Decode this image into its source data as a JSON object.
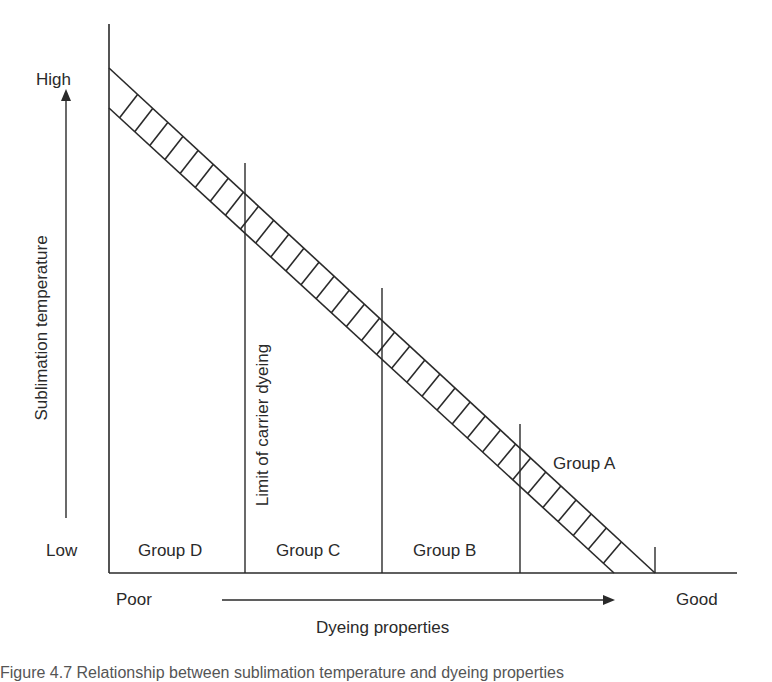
{
  "diagram": {
    "y_axis": {
      "label": "Sublimation temperature",
      "high_label": "High",
      "low_label": "Low"
    },
    "x_axis": {
      "label": "Dyeing properties",
      "poor_label": "Poor",
      "good_label": "Good"
    },
    "groups": [
      {
        "label": "Group D"
      },
      {
        "label": "Group C"
      },
      {
        "label": "Group B"
      },
      {
        "label": "Group A"
      }
    ],
    "annotation": "Limit of carrier dyeing",
    "band": {
      "description": "Hatched diagonal band from high sublimation temperature / poor dyeing to low sublimation temperature / good dyeing",
      "hatch_count": 33
    },
    "colors": {
      "line": "#2a2a2a",
      "background": "#ffffff"
    }
  },
  "caption": "Figure 4.7 Relationship between sublimation temperature and dyeing properties"
}
